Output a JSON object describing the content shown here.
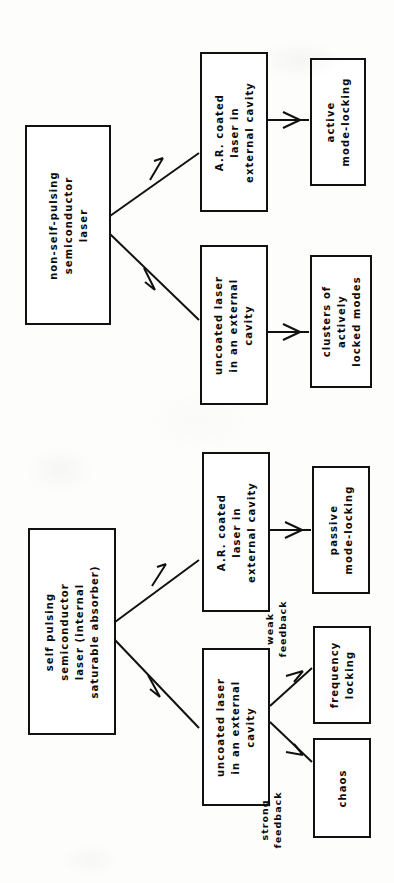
{
  "page": {
    "background_color": "#fdfdfb",
    "ink_color": "#111111",
    "orientation": "rotated-90-ccw"
  },
  "charts": [
    {
      "id": "non-self-pulsing-chart",
      "name": "non-self-pulsing semiconductor laser flowchart",
      "nodes": [
        {
          "id": "node-non-self-pulsing",
          "name": "non-self-pulsing-laser-box",
          "lines": [
            "non-self-pulsing",
            "semiconductor",
            "laser"
          ]
        },
        {
          "id": "node-ar-coated-top",
          "name": "ar-coated-laser-box",
          "lines": [
            "A.R. coated",
            "laser in",
            "external cavity"
          ]
        },
        {
          "id": "node-active-mode-locking",
          "name": "active-mode-locking-box",
          "lines": [
            "active",
            "mode-locking"
          ]
        },
        {
          "id": "node-uncoated-top",
          "name": "uncoated-laser-box",
          "lines": [
            "uncoated laser",
            "in an external",
            "cavity"
          ]
        },
        {
          "id": "node-clusters",
          "name": "clusters-of-actively-locked-modes-box",
          "lines": [
            "clusters of",
            "actively",
            "locked modes"
          ]
        }
      ],
      "edge_labels": []
    },
    {
      "id": "self-pulsing-chart",
      "name": "self pulsing semiconductor laser flowchart",
      "nodes": [
        {
          "id": "node-self-pulsing",
          "name": "self-pulsing-laser-box",
          "lines": [
            "self pulsing",
            "semiconductor",
            "laser (internal",
            "saturable absorber)"
          ]
        },
        {
          "id": "node-ar-coated-bottom",
          "name": "ar-coated-laser-box",
          "lines": [
            "A.R. coated",
            "laser in",
            "external cavity"
          ]
        },
        {
          "id": "node-passive-mode-locking",
          "name": "passive-mode-locking-box",
          "lines": [
            "passive",
            "mode-locking"
          ]
        },
        {
          "id": "node-uncoated-bottom",
          "name": "uncoated-laser-box",
          "lines": [
            "uncoated laser",
            "in an external",
            "cavity"
          ]
        },
        {
          "id": "node-frequency-locking",
          "name": "frequency-locking-box",
          "lines": [
            "frequency",
            "locking"
          ]
        },
        {
          "id": "node-chaos",
          "name": "chaos-box",
          "lines": [
            "chaos"
          ]
        }
      ],
      "edge_labels": [
        {
          "id": "label-weak-feedback",
          "name": "weak-feedback-label",
          "lines": [
            "weak",
            "feedback"
          ]
        },
        {
          "id": "label-strong-feedback",
          "name": "strong-feedback-label",
          "lines": [
            "strong",
            "feedback"
          ]
        }
      ]
    }
  ]
}
